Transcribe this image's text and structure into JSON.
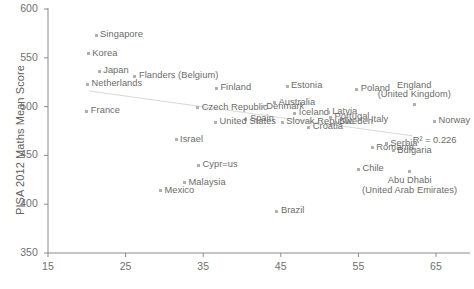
{
  "chart_data": {
    "type": "scatter",
    "title": "",
    "xlabel": "",
    "ylabel": "PISA 2012 Maths Mean Score",
    "xlim": [
      15,
      69.5
    ],
    "ylim": [
      350,
      600
    ],
    "xticks": [
      15,
      25,
      35,
      45,
      55,
      65
    ],
    "yticks": [
      350,
      400,
      450,
      500,
      550,
      600
    ],
    "grid": false,
    "legend": null,
    "annotations": [
      {
        "name": "r-squared",
        "text": "R² = 0.226",
        "x": 62.0,
        "y": 466
      }
    ],
    "trendline": {
      "type": "linear",
      "x_start": 20.3,
      "y_start": 516,
      "x_end": 62.0,
      "y_end": 470,
      "r_squared": 0.226
    },
    "points": [
      {
        "label": "Singapore",
        "x": 21.2,
        "y": 573,
        "label_pos": "right"
      },
      {
        "label": "Korea",
        "x": 20.2,
        "y": 554,
        "label_pos": "right"
      },
      {
        "label": "Japan",
        "x": 21.6,
        "y": 536,
        "label_pos": "right"
      },
      {
        "label": "Netherlands",
        "x": 20.1,
        "y": 523,
        "label_pos": "right"
      },
      {
        "label": "Flanders (Belgium)",
        "x": 26.2,
        "y": 531,
        "label_pos": "right"
      },
      {
        "label": "Finland",
        "x": 36.7,
        "y": 519,
        "label_pos": "right"
      },
      {
        "label": "Estonia",
        "x": 45.8,
        "y": 521,
        "label_pos": "right"
      },
      {
        "label": "Poland",
        "x": 54.8,
        "y": 518,
        "label_pos": "right"
      },
      {
        "label": "England\n(United Kingdom)",
        "x": 62.2,
        "y": 502,
        "label_pos": "above-center"
      },
      {
        "label": "France",
        "x": 20.0,
        "y": 495,
        "label_pos": "right"
      },
      {
        "label": "Czech Republic",
        "x": 34.3,
        "y": 499,
        "label_pos": "right"
      },
      {
        "label": "Australia",
        "x": 44.2,
        "y": 504,
        "label_pos": "right"
      },
      {
        "label": "Denmark",
        "x": 42.6,
        "y": 500,
        "label_pos": "right"
      },
      {
        "label": "Iceland",
        "x": 46.8,
        "y": 493,
        "label_pos": "right"
      },
      {
        "label": "Latvia",
        "x": 51.1,
        "y": 494,
        "label_pos": "right"
      },
      {
        "label": "Portugal",
        "x": 51.4,
        "y": 489,
        "label_pos": "right"
      },
      {
        "label": "Spain",
        "x": 40.5,
        "y": 487,
        "label_pos": "right"
      },
      {
        "label": "United States",
        "x": 36.6,
        "y": 484,
        "label_pos": "right"
      },
      {
        "label": "Slovak Republic",
        "x": 45.2,
        "y": 484,
        "label_pos": "right"
      },
      {
        "label": "Sweden",
        "x": 52.0,
        "y": 484,
        "label_pos": "right"
      },
      {
        "label": "Italy",
        "x": 56.1,
        "y": 486,
        "label_pos": "right"
      },
      {
        "label": "Norway",
        "x": 64.8,
        "y": 485,
        "label_pos": "right"
      },
      {
        "label": "Croatia",
        "x": 48.6,
        "y": 479,
        "label_pos": "right"
      },
      {
        "label": "Israel",
        "x": 31.5,
        "y": 466,
        "label_pos": "right"
      },
      {
        "label": "Serbia",
        "x": 58.6,
        "y": 462,
        "label_pos": "right"
      },
      {
        "label": "Romania",
        "x": 56.8,
        "y": 458,
        "label_pos": "right"
      },
      {
        "label": "Bulgaria",
        "x": 59.5,
        "y": 455,
        "label_pos": "right"
      },
      {
        "label": "Cypr=us",
        "x": 34.4,
        "y": 440,
        "label_pos": "right"
      },
      {
        "label": "Chile",
        "x": 55.0,
        "y": 436,
        "label_pos": "right"
      },
      {
        "label": "Abu Dhabi\n(United Arab Emirates)",
        "x": 61.6,
        "y": 434,
        "label_pos": "below-center"
      },
      {
        "label": "Malaysia",
        "x": 32.6,
        "y": 422,
        "label_pos": "right"
      },
      {
        "label": "Mexico",
        "x": 29.5,
        "y": 414,
        "label_pos": "right"
      },
      {
        "label": "Brazil",
        "x": 44.5,
        "y": 393,
        "label_pos": "right"
      }
    ]
  }
}
